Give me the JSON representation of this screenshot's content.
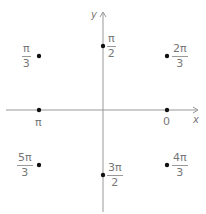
{
  "axes": {
    "x_label": "x",
    "y_label": "y",
    "color": "#999999"
  },
  "points": [
    {
      "id": "pi_over_2",
      "num": "π",
      "den": "2",
      "x": 103,
      "y": 46
    },
    {
      "id": "pi_over_3",
      "num": "π",
      "den": "3",
      "x": 39,
      "y": 56
    },
    {
      "id": "two_pi_over_3",
      "num": "2π",
      "den": "3",
      "x": 167,
      "y": 56
    },
    {
      "id": "pi",
      "label": "π",
      "x": 39,
      "y": 110
    },
    {
      "id": "zero",
      "label": "0",
      "x": 167,
      "y": 110
    },
    {
      "id": "five_pi_over_3",
      "num": "5π",
      "den": "3",
      "x": 39,
      "y": 165
    },
    {
      "id": "three_pi_over_2",
      "num": "3π",
      "den": "2",
      "x": 103,
      "y": 175
    },
    {
      "id": "four_pi_over_3",
      "num": "4π",
      "den": "3",
      "x": 167,
      "y": 165
    }
  ],
  "labels": {
    "pi_over_2": {
      "num": "π",
      "den": "2"
    },
    "pi_over_3": {
      "num": "π",
      "den": "3"
    },
    "two_pi_over_3": {
      "num": "2π",
      "den": "3"
    },
    "pi": "π",
    "zero": "0",
    "five_pi_over_3": {
      "num": "5π",
      "den": "3"
    },
    "three_pi_over_2": {
      "num": "3π",
      "den": "2"
    },
    "four_pi_over_3": {
      "num": "4π",
      "den": "3"
    }
  }
}
